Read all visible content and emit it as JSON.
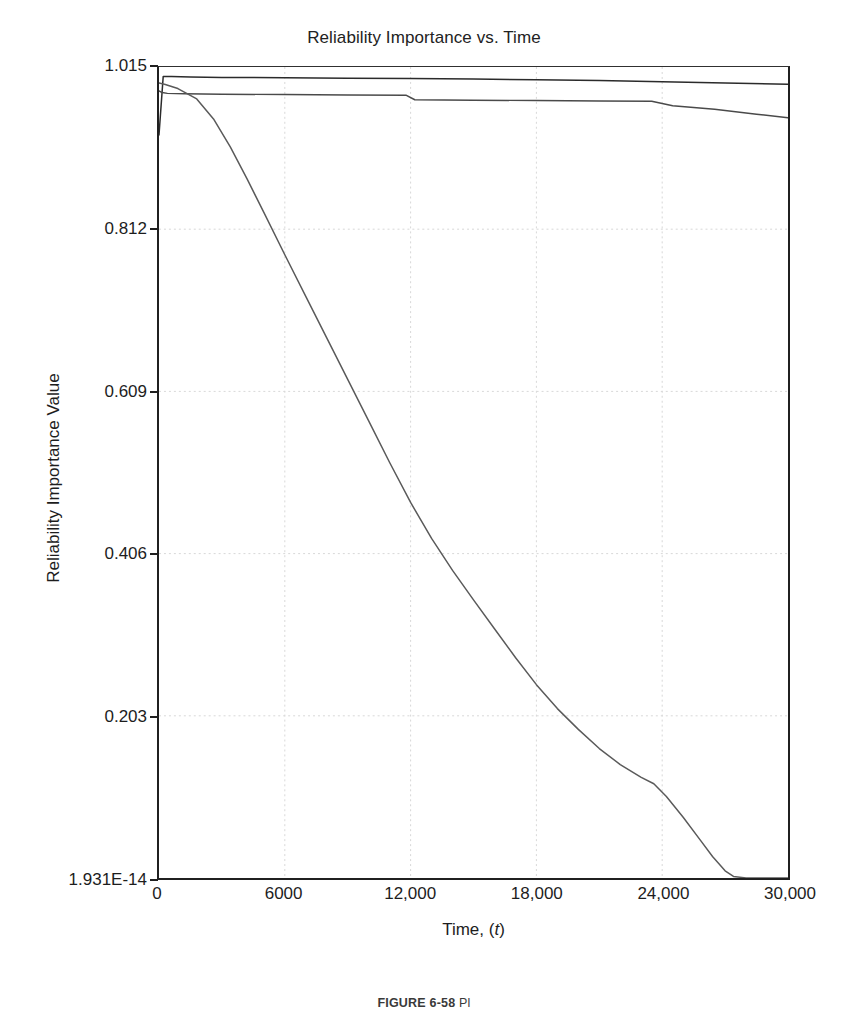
{
  "chart_data": {
    "type": "line",
    "title": "Reliability Importance vs. Time",
    "xlabel": "Time, (t)",
    "ylabel": "Reliability Importance Value",
    "xlim": [
      0,
      30000
    ],
    "ylim": [
      0,
      1.015
    ],
    "grid": true,
    "legend": "none",
    "xticks": [
      0,
      6000,
      12000,
      18000,
      24000,
      30000
    ],
    "xtick_labels": [
      "0",
      "6000",
      "12,000",
      "18,000",
      "24,000",
      "30,000"
    ],
    "yticks": [
      1.015,
      0.812,
      0.609,
      0.406,
      0.203,
      0.0
    ],
    "ytick_labels": [
      "1.015",
      "0.812",
      "0.609",
      "0.406",
      "0.203",
      "1.931E-14"
    ],
    "series": [
      {
        "name": "Component 1",
        "color": "#2b2b2b",
        "x": [
          0,
          200,
          600,
          1500,
          3000,
          6000,
          9000,
          12000,
          15000,
          18000,
          21000,
          24000,
          27000,
          30000
        ],
        "y": [
          0.93,
          1.003,
          1.003,
          1.0025,
          1.002,
          1.0015,
          1.001,
          1.0005,
          1.0,
          0.999,
          0.998,
          0.9965,
          0.995,
          0.9935
        ]
      },
      {
        "name": "Component 2",
        "color": "#4a4a4a",
        "x": [
          0,
          150,
          400,
          1200,
          3000,
          6000,
          9000,
          11800,
          12200,
          15000,
          18000,
          21000,
          23500,
          24500,
          26500,
          28500,
          30000
        ],
        "y": [
          0.985,
          0.983,
          0.982,
          0.9815,
          0.981,
          0.9805,
          0.98,
          0.9795,
          0.974,
          0.9735,
          0.973,
          0.9725,
          0.972,
          0.9665,
          0.962,
          0.956,
          0.9515
        ]
      },
      {
        "name": "Component 3",
        "color": "#5a5a5a",
        "x": [
          0,
          300,
          900,
          1800,
          2600,
          3400,
          4200,
          5000,
          6000,
          7000,
          8000,
          9000,
          10000,
          11000,
          12000,
          13000,
          14000,
          15000,
          16000,
          17000,
          18000,
          19000,
          20000,
          21000,
          22000,
          23000,
          23600,
          24200,
          25000,
          25800,
          26400,
          27000,
          27400,
          28000,
          30000
        ],
        "y": [
          0.995,
          0.993,
          0.988,
          0.975,
          0.95,
          0.915,
          0.875,
          0.833,
          0.78,
          0.728,
          0.676,
          0.624,
          0.572,
          0.52,
          0.47,
          0.425,
          0.385,
          0.348,
          0.312,
          0.276,
          0.242,
          0.212,
          0.186,
          0.162,
          0.142,
          0.126,
          0.118,
          0.102,
          0.076,
          0.048,
          0.027,
          0.009,
          0.002,
          0.0,
          0.0
        ]
      }
    ],
    "axis_line_color": "#202020",
    "grid_color": "#d8d8d8"
  },
  "caption": {
    "label": "FIGURE 6-58",
    "text": "Pl"
  }
}
